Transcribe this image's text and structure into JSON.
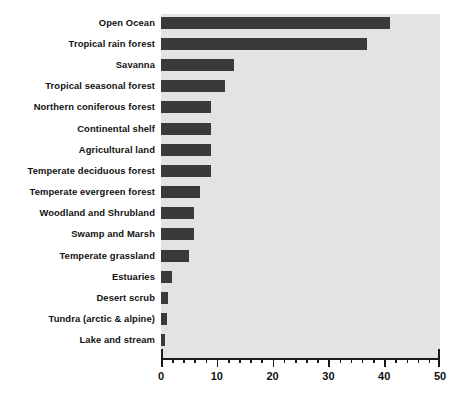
{
  "chart_data": {
    "type": "bar",
    "orientation": "horizontal",
    "title": "",
    "subtitle": "",
    "xlabel": "",
    "ylabel": "",
    "xlim": [
      0,
      50
    ],
    "grid": false,
    "legend": null,
    "bar_color": "#3a3a3a",
    "plot_background": "#e3e3e3",
    "x_major_ticks": [
      0,
      10,
      20,
      30,
      40,
      50
    ],
    "x_minor_tick_step": 2,
    "x_tick_labels": [
      "0",
      "10",
      "20",
      "30",
      "40",
      "50"
    ],
    "categories": [
      "Open Ocean",
      "Tropical rain forest",
      "Savanna",
      "Tropical seasonal forest",
      "Northern coniferous forest",
      "Continental shelf",
      "Agricultural land",
      "Temperate deciduous forest",
      "Temperate evergreen forest",
      "Woodland and Shrubland",
      "Swamp and Marsh",
      "Temperate grassland",
      "Estuaries",
      "Desert scrub",
      "Tundra (arctic & alpine)",
      "Lake and stream"
    ],
    "values": [
      41,
      37,
      13,
      11.5,
      9,
      9,
      9,
      9,
      7,
      6,
      6,
      5,
      2,
      1.3,
      1,
      0.7
    ]
  }
}
